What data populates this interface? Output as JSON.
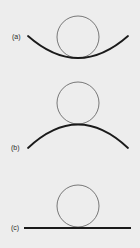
{
  "figure": {
    "background": "#ededed",
    "stroke_color": "#1a1a1a",
    "circle_color": "#6a6a6a",
    "panels": [
      {
        "id": "a",
        "label": "(a)",
        "surface": "concave",
        "description": "circle resting inside a concave (upward-opening) curve"
      },
      {
        "id": "b",
        "label": "(b)",
        "surface": "convex",
        "description": "circle resting on top of a convex (downward-opening) curve"
      },
      {
        "id": "c",
        "label": "(c)",
        "surface": "flat",
        "description": "circle resting on a flat line"
      }
    ]
  }
}
